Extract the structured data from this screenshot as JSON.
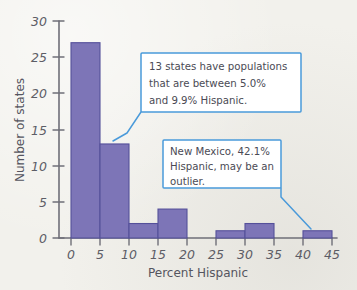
{
  "chart_data": {
    "type": "bar",
    "title": "",
    "subtitle": "",
    "xlabel": "Percent Hispanic",
    "ylabel": "Number of states",
    "xlim": [
      0,
      45
    ],
    "ylim": [
      0,
      30
    ],
    "bin_width": 5,
    "grid": false,
    "legend": "none",
    "categories": [
      "0-5",
      "5-10",
      "10-15",
      "15-20",
      "20-25",
      "25-30",
      "30-35",
      "35-40",
      "40-45"
    ],
    "bin_starts": [
      0,
      5,
      10,
      15,
      20,
      25,
      30,
      35,
      40
    ],
    "values": [
      27,
      13,
      2,
      4,
      0,
      1,
      2,
      0,
      1
    ],
    "xticks": [
      "0",
      "5",
      "10",
      "15",
      "20",
      "25",
      "30",
      "35",
      "40",
      "45"
    ],
    "xtick_values": [
      0,
      5,
      10,
      15,
      20,
      25,
      30,
      35,
      40,
      45
    ],
    "yticks": [
      "0",
      "5",
      "10",
      "15",
      "20",
      "25",
      "30"
    ],
    "ytick_values": [
      0,
      5,
      10,
      15,
      20,
      25,
      30
    ],
    "colors": {
      "bar_fill": "#7d75b7",
      "bar_stroke": "#55509a",
      "axis": "#6f6f78",
      "callout_border": "#4a9ada",
      "text": "#5d5d66",
      "background": "#f2f1ec"
    },
    "annotations": [
      {
        "id": "annotation-bin-5-10",
        "lines": [
          "13 states have populations",
          "that are between 5.0%",
          "and 9.9% Hispanic."
        ],
        "points_to_bin": "5-10"
      },
      {
        "id": "annotation-outlier",
        "lines": [
          "New Mexico, 42.1%",
          "Hispanic, may be an",
          "outlier."
        ],
        "points_to_bin": "40-45"
      }
    ]
  }
}
